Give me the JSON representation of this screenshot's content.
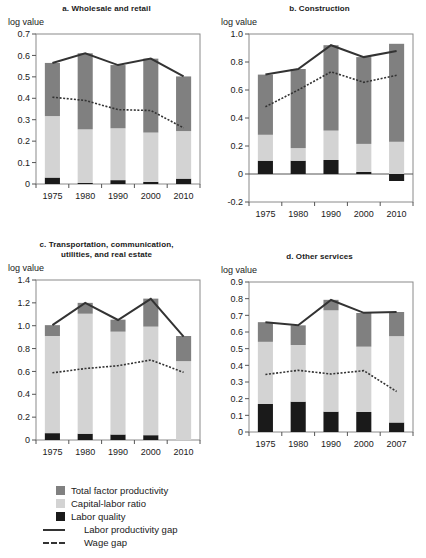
{
  "figure": {
    "axis_label": "log value",
    "colors": {
      "tfp": "#808080",
      "klr": "#d3d3d3",
      "lq": "#1a1a1a",
      "line": "#333333"
    }
  },
  "legend": {
    "items": [
      {
        "key": "tfp",
        "label": "Total factor productivity",
        "style": "swatch"
      },
      {
        "key": "klr",
        "label": "Capital-labor ratio",
        "style": "swatch"
      },
      {
        "key": "lq",
        "label": "Labor quality",
        "style": "swatch"
      },
      {
        "key": "lpg",
        "label": "Labor productivity gap",
        "style": "solid-line"
      },
      {
        "key": "wage",
        "label": "Wage gap",
        "style": "dotted-line"
      }
    ]
  },
  "chart_data": [
    {
      "id": "panel-a",
      "type": "bar",
      "title": "a. Wholesale and retail",
      "ylabel": "log value",
      "xlabel": "",
      "categories": [
        "1975",
        "1980",
        "1990",
        "2000",
        "2010"
      ],
      "ylim": [
        0,
        0.7
      ],
      "yticks": [
        "0",
        "0.1",
        "0.2",
        "0.3",
        "0.4",
        "0.5",
        "0.6",
        "0.7"
      ],
      "ytick_values": [
        0,
        0.1,
        0.2,
        0.3,
        0.4,
        0.5,
        0.6,
        0.7
      ],
      "grid": false,
      "legend_position": "below-figure",
      "series": [
        {
          "name": "Labor quality",
          "values": [
            0.03,
            0.005,
            0.018,
            0.01,
            0.025
          ]
        },
        {
          "name": "Capital-labor ratio",
          "values": [
            0.287,
            0.25,
            0.242,
            0.23,
            0.222
          ]
        },
        {
          "name": "Total factor productivity",
          "values": [
            0.248,
            0.355,
            0.295,
            0.345,
            0.255
          ]
        }
      ],
      "lines": [
        {
          "name": "Labor productivity gap",
          "values": [
            0.565,
            0.61,
            0.555,
            0.585,
            0.502
          ]
        },
        {
          "name": "Wage gap",
          "values": [
            0.405,
            0.39,
            0.347,
            0.343,
            0.262
          ]
        }
      ]
    },
    {
      "id": "panel-b",
      "type": "bar",
      "title": "b. Construction",
      "ylabel": "log value",
      "xlabel": "",
      "categories": [
        "1975",
        "1980",
        "1990",
        "2000",
        "2010"
      ],
      "ylim": [
        -0.2,
        1.0
      ],
      "yticks": [
        "-0.2",
        "0",
        "0.2",
        "0.4",
        "0.6",
        "0.8",
        "1.0"
      ],
      "ytick_values": [
        -0.2,
        0,
        0.2,
        0.4,
        0.6,
        0.8,
        1.0
      ],
      "grid": false,
      "legend_position": "below-figure",
      "series": [
        {
          "name": "Labor quality",
          "values": [
            0.095,
            0.095,
            0.1,
            0.015,
            -0.05
          ]
        },
        {
          "name": "Capital-labor ratio",
          "values": [
            0.185,
            0.09,
            0.21,
            0.2,
            0.23
          ]
        },
        {
          "name": "Total factor productivity",
          "values": [
            0.43,
            0.565,
            0.61,
            0.62,
            0.7
          ]
        }
      ],
      "lines": [
        {
          "name": "Labor productivity gap",
          "values": [
            0.71,
            0.75,
            0.92,
            0.835,
            0.878
          ]
        },
        {
          "name": "Wage gap",
          "values": [
            0.48,
            0.6,
            0.73,
            0.655,
            0.705
          ]
        }
      ]
    },
    {
      "id": "panel-c",
      "type": "bar",
      "title": "c. Transportation, communication, utilities, and real estate",
      "title_lines": [
        "c. Transportation, communication,",
        "utilities, and real estate"
      ],
      "ylabel": "log value",
      "xlabel": "",
      "categories": [
        "1975",
        "1980",
        "1990",
        "2000",
        "2010"
      ],
      "ylim": [
        0,
        1.4
      ],
      "yticks": [
        "0",
        "0.2",
        "0.4",
        "0.6",
        "0.8",
        "1.0",
        "1.2",
        "1.4"
      ],
      "ytick_values": [
        0,
        0.2,
        0.4,
        0.6,
        0.8,
        1.0,
        1.2,
        1.4
      ],
      "grid": false,
      "legend_position": "below-figure",
      "series": [
        {
          "name": "Labor quality",
          "values": [
            0.06,
            0.055,
            0.048,
            0.042,
            0.0
          ]
        },
        {
          "name": "Capital-labor ratio",
          "values": [
            0.85,
            1.05,
            0.9,
            0.95,
            0.69
          ]
        },
        {
          "name": "Total factor productivity",
          "values": [
            0.095,
            0.095,
            0.105,
            0.245,
            0.22
          ]
        }
      ],
      "lines": [
        {
          "name": "Labor productivity gap",
          "values": [
            1.005,
            1.2,
            1.05,
            1.235,
            0.905
          ]
        },
        {
          "name": "Wage gap",
          "values": [
            0.588,
            0.625,
            0.65,
            0.7,
            0.592
          ]
        }
      ]
    },
    {
      "id": "panel-d",
      "type": "bar",
      "title": "d. Other services",
      "ylabel": "log value",
      "xlabel": "",
      "categories": [
        "1975",
        "1980",
        "1990",
        "2000",
        "2007"
      ],
      "ylim": [
        0,
        0.9
      ],
      "yticks": [
        "0",
        "0.1",
        "0.2",
        "0.3",
        "0.4",
        "0.5",
        "0.6",
        "0.7",
        "0.8",
        "0.9"
      ],
      "ytick_values": [
        0,
        0.1,
        0.2,
        0.3,
        0.4,
        0.5,
        0.6,
        0.7,
        0.8,
        0.9
      ],
      "grid": false,
      "legend_position": "below-figure",
      "series": [
        {
          "name": "Labor quality",
          "values": [
            0.168,
            0.182,
            0.122,
            0.12,
            0.057
          ]
        },
        {
          "name": "Capital-labor ratio",
          "values": [
            0.373,
            0.34,
            0.608,
            0.392,
            0.518
          ]
        },
        {
          "name": "Total factor productivity",
          "values": [
            0.118,
            0.118,
            0.063,
            0.202,
            0.145
          ]
        }
      ],
      "lines": [
        {
          "name": "Labor productivity gap",
          "values": [
            0.658,
            0.64,
            0.792,
            0.715,
            0.72
          ]
        },
        {
          "name": "Wage gap",
          "values": [
            0.345,
            0.37,
            0.348,
            0.368,
            0.243
          ]
        }
      ]
    }
  ]
}
